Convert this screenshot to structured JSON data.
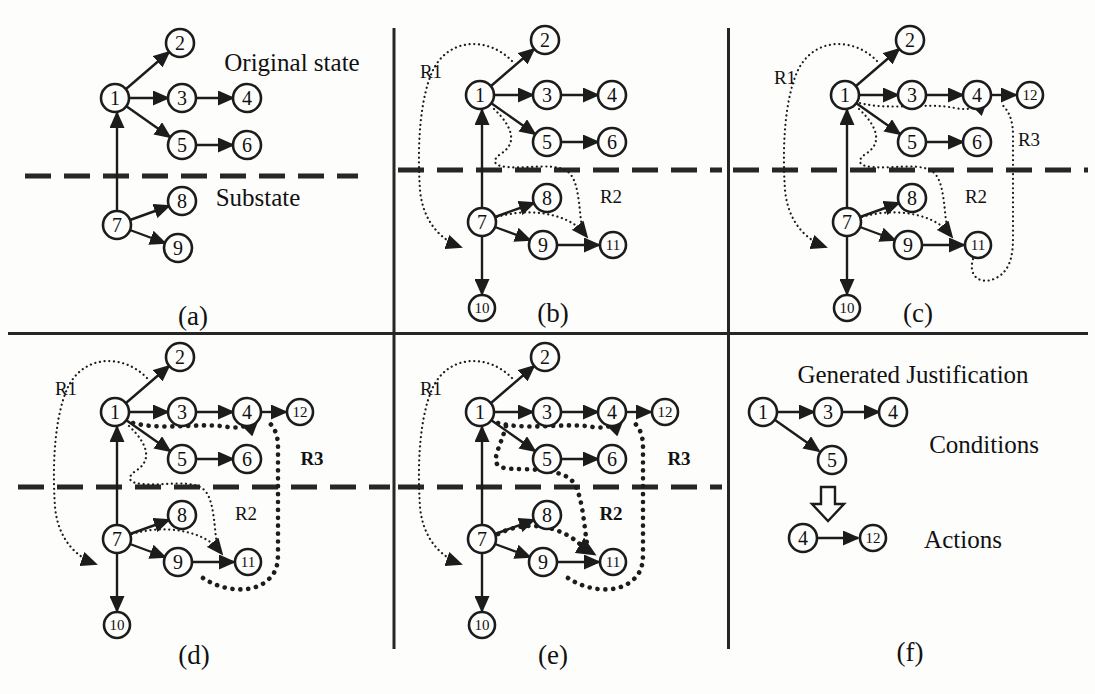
{
  "colors": {
    "ink": "#1c1c1c",
    "paper": "#fdfdfc"
  },
  "panels": {
    "a": {
      "caption": "(a)",
      "original_state_label": "Original state",
      "substate_label": "Substate",
      "nodes": [
        "1",
        "2",
        "3",
        "4",
        "5",
        "6",
        "7",
        "8",
        "9"
      ],
      "edges": [
        [
          "1",
          "2"
        ],
        [
          "1",
          "3"
        ],
        [
          "3",
          "4"
        ],
        [
          "1",
          "5"
        ],
        [
          "5",
          "6"
        ],
        [
          "7",
          "1"
        ],
        [
          "7",
          "8"
        ],
        [
          "7",
          "9"
        ]
      ]
    },
    "b": {
      "caption": "(b)",
      "nodes": [
        "1",
        "2",
        "3",
        "4",
        "5",
        "6",
        "7",
        "8",
        "9",
        "10",
        "11"
      ],
      "edges": [
        [
          "1",
          "2"
        ],
        [
          "1",
          "3"
        ],
        [
          "3",
          "4"
        ],
        [
          "1",
          "5"
        ],
        [
          "5",
          "6"
        ],
        [
          "7",
          "1"
        ],
        [
          "7",
          "8"
        ],
        [
          "7",
          "9"
        ],
        [
          "7",
          "10"
        ],
        [
          "9",
          "11"
        ]
      ],
      "rules": [
        {
          "label": "R1",
          "emphasized": false
        },
        {
          "label": "R2",
          "emphasized": false
        }
      ]
    },
    "c": {
      "caption": "(c)",
      "nodes": [
        "1",
        "2",
        "3",
        "4",
        "5",
        "6",
        "7",
        "8",
        "9",
        "10",
        "11",
        "12"
      ],
      "edges": [
        [
          "1",
          "2"
        ],
        [
          "1",
          "3"
        ],
        [
          "3",
          "4"
        ],
        [
          "1",
          "5"
        ],
        [
          "5",
          "6"
        ],
        [
          "7",
          "1"
        ],
        [
          "7",
          "8"
        ],
        [
          "7",
          "9"
        ],
        [
          "7",
          "10"
        ],
        [
          "9",
          "11"
        ],
        [
          "4",
          "12"
        ]
      ],
      "rules": [
        {
          "label": "R1",
          "emphasized": false
        },
        {
          "label": "R2",
          "emphasized": false
        },
        {
          "label": "R3",
          "emphasized": false
        }
      ]
    },
    "d": {
      "caption": "(d)",
      "nodes": [
        "1",
        "2",
        "3",
        "4",
        "5",
        "6",
        "7",
        "8",
        "9",
        "10",
        "11",
        "12"
      ],
      "edges": [
        [
          "1",
          "2"
        ],
        [
          "1",
          "3"
        ],
        [
          "3",
          "4"
        ],
        [
          "1",
          "5"
        ],
        [
          "5",
          "6"
        ],
        [
          "7",
          "1"
        ],
        [
          "7",
          "8"
        ],
        [
          "7",
          "9"
        ],
        [
          "7",
          "10"
        ],
        [
          "9",
          "11"
        ],
        [
          "4",
          "12"
        ]
      ],
      "rules": [
        {
          "label": "R1",
          "emphasized": false
        },
        {
          "label": "R2",
          "emphasized": false
        },
        {
          "label": "R3",
          "emphasized": true
        }
      ]
    },
    "e": {
      "caption": "(e)",
      "nodes": [
        "1",
        "2",
        "3",
        "4",
        "5",
        "6",
        "7",
        "8",
        "9",
        "10",
        "11",
        "12"
      ],
      "edges": [
        [
          "1",
          "2"
        ],
        [
          "1",
          "3"
        ],
        [
          "3",
          "4"
        ],
        [
          "1",
          "5"
        ],
        [
          "5",
          "6"
        ],
        [
          "7",
          "1"
        ],
        [
          "7",
          "8"
        ],
        [
          "7",
          "9"
        ],
        [
          "7",
          "10"
        ],
        [
          "9",
          "11"
        ],
        [
          "4",
          "12"
        ]
      ],
      "rules": [
        {
          "label": "R1",
          "emphasized": false
        },
        {
          "label": "R2",
          "emphasized": true
        },
        {
          "label": "R3",
          "emphasized": true
        }
      ]
    },
    "f": {
      "caption": "(f)",
      "title": "Generated Justification",
      "conditions_label": "Conditions",
      "actions_label": "Actions",
      "conditions": {
        "nodes": [
          "1",
          "3",
          "4",
          "5"
        ],
        "edges": [
          [
            "1",
            "3"
          ],
          [
            "3",
            "4"
          ],
          [
            "1",
            "5"
          ]
        ]
      },
      "actions": {
        "nodes": [
          "4",
          "12"
        ],
        "edges": [
          [
            "4",
            "12"
          ]
        ]
      }
    }
  }
}
